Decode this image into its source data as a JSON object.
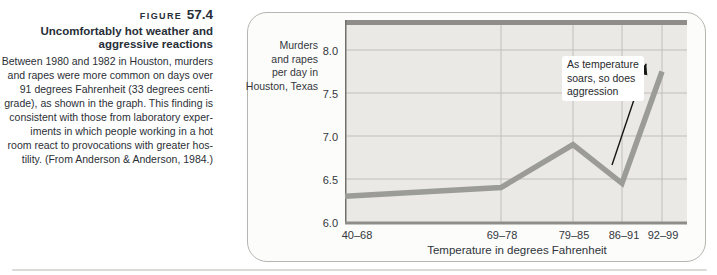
{
  "caption": {
    "figure_label": "FIGURE",
    "figure_number": "57.4",
    "title": "Uncomfortably hot weather and\naggressive reactions",
    "body": "Between 1980 and 1982 in Houston, murders\nand rapes were more common on days over\n91 degrees Fahrenheit (33 degrees centi-\ngrade), as shown in the graph. This finding is\nconsistent with those from laboratory exper-\niments in which people working in a hot\nroom react to provocations with greater hos-\ntility. (From Anderson & Anderson, 1984.)"
  },
  "chart_data": {
    "type": "line",
    "categories": [
      "40–68",
      "69–78",
      "79–85",
      "86–91",
      "92–99"
    ],
    "values": [
      6.3,
      6.4,
      6.9,
      6.45,
      7.75
    ],
    "title": "",
    "xlabel": "Temperature in degrees Fahrenheit",
    "ylabel": "Murders\nand rapes\nper day in\nHouston, Texas",
    "yticks": [
      6.0,
      6.5,
      7.0,
      7.5,
      8.0
    ],
    "ylim": [
      6.0,
      8.35
    ],
    "grid": true,
    "legend": "none",
    "annotation": "As temperature\nsoars, so does\naggression"
  },
  "colors": {
    "plot_bg": "#eae9e5",
    "grid": "#c0bfbb",
    "axis_heavy": "#8e8d8a",
    "axis": "#70706d",
    "line": "#9b9b98",
    "arrow": "#161616",
    "text": "#2b2f36",
    "panel_border": "#b7b5b1"
  }
}
